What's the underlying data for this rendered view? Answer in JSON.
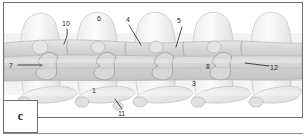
{
  "figure": {
    "panel_letter": "c",
    "callouts": [
      {
        "id": "callout-10",
        "label": "10",
        "x": 62,
        "y": 20
      },
      {
        "id": "callout-6",
        "label": "6",
        "x": 97,
        "y": 15
      },
      {
        "id": "callout-4",
        "label": "4",
        "x": 126,
        "y": 16
      },
      {
        "id": "callout-5",
        "label": "5",
        "x": 177,
        "y": 17
      },
      {
        "id": "callout-7",
        "label": "7",
        "x": 9,
        "y": 62
      },
      {
        "id": "callout-8",
        "label": "8",
        "x": 206,
        "y": 63
      },
      {
        "id": "callout-12",
        "label": "12",
        "x": 270,
        "y": 64
      },
      {
        "id": "callout-3",
        "label": "3",
        "x": 192,
        "y": 80
      },
      {
        "id": "callout-1",
        "label": "1",
        "x": 92,
        "y": 87
      },
      {
        "id": "callout-11",
        "label": "11",
        "x": 118,
        "y": 110
      }
    ],
    "palette": {
      "frame_border": "#6e6e6e",
      "background": "#ffffff",
      "bone_light": "#f0f0f0",
      "bone_mid": "#dcdcdc",
      "bone_shade": "#c9c9c9",
      "outline": "#b0b0b0",
      "leader_line": "#222222",
      "text": "#2a2a2a"
    }
  }
}
